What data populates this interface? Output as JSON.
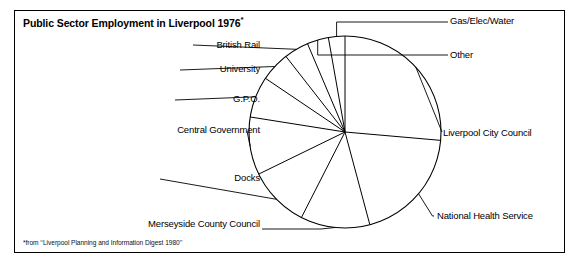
{
  "title": "Public Sector Employment in Liverpool 1976",
  "title_asterisk": "*",
  "footnote": "*from ‘‘Liverpool Planning and Information Digest 1980’’",
  "colors": {
    "frame": "#000000",
    "pie_outline": "#000000",
    "leader_line": "#000000",
    "background": "#ffffff",
    "text": "#000000"
  },
  "labels": {
    "gas_elec_water": "Gas/Elec/Water",
    "other": "Other",
    "liverpool_city_council": "Liverpool City Council",
    "national_health_service": "National Health Service",
    "merseyside_county_council": "Merseyside County Council",
    "docks": "Docks",
    "central_government": "Central Government",
    "gpo": "G.P.O.",
    "university": "University",
    "british_rail": "British Rail"
  },
  "chart_data": {
    "type": "pie",
    "title": "Public Sector Employment in Liverpool 1976*",
    "source_note": "*from ‘‘Liverpool Planning and Information Digest 1980’’",
    "start_angle_deg": 0,
    "direction": "clockwise",
    "legend": "none (direct leader-line labels)",
    "labels": [
      "Liverpool City Council",
      "National Health Service",
      "Merseyside County Council",
      "Docks",
      "Central Government",
      "G.P.O.",
      "University",
      "British Rail",
      "Other",
      "Gas/Elec/Water"
    ],
    "values_deg": [
      95,
      70,
      42,
      37,
      35,
      25,
      18,
      15,
      13,
      10
    ],
    "values_pct": [
      26.4,
      19.4,
      11.7,
      10.3,
      9.7,
      6.9,
      5.0,
      4.2,
      3.6,
      2.8
    ]
  }
}
